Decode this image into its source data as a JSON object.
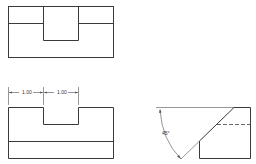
{
  "figure": {
    "top_view": {
      "description": "top view of notched block"
    },
    "front_view": {
      "dimensions": [
        {
          "label": "1.00"
        },
        {
          "label": "1.00"
        }
      ]
    },
    "side_view": {
      "angle_label": "45°"
    }
  },
  "colors": {
    "line": "#3a3a3a",
    "background": "#ffffff"
  }
}
